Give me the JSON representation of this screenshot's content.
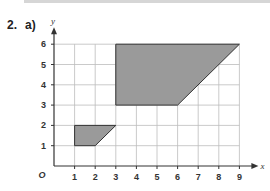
{
  "question": {
    "number": "2.",
    "part": "a)"
  },
  "chart_data": {
    "type": "diagram",
    "title": "",
    "xlabel": "x",
    "ylabel": "y",
    "origin_label": "O",
    "xlim": [
      0,
      9
    ],
    "ylim": [
      0,
      6
    ],
    "x_ticks": [
      "1",
      "2",
      "3",
      "4",
      "5",
      "6",
      "7",
      "8",
      "9"
    ],
    "y_ticks": [
      "1",
      "2",
      "3",
      "4",
      "5",
      "6"
    ],
    "grid": true,
    "shapes": [
      {
        "name": "small-trapezium",
        "vertices": [
          [
            1,
            1
          ],
          [
            2,
            1
          ],
          [
            3,
            2
          ],
          [
            1,
            2
          ]
        ],
        "fill": "#9a9a9a"
      },
      {
        "name": "large-trapezium",
        "vertices": [
          [
            3,
            3
          ],
          [
            6,
            3
          ],
          [
            9,
            6
          ],
          [
            3,
            6
          ]
        ],
        "fill": "#9a9a9a"
      }
    ]
  },
  "colors": {
    "shape_fill": "#9a9a9a",
    "grid": "#bdbdbd",
    "axis": "#333333",
    "topbar": "#d6d6d6"
  }
}
